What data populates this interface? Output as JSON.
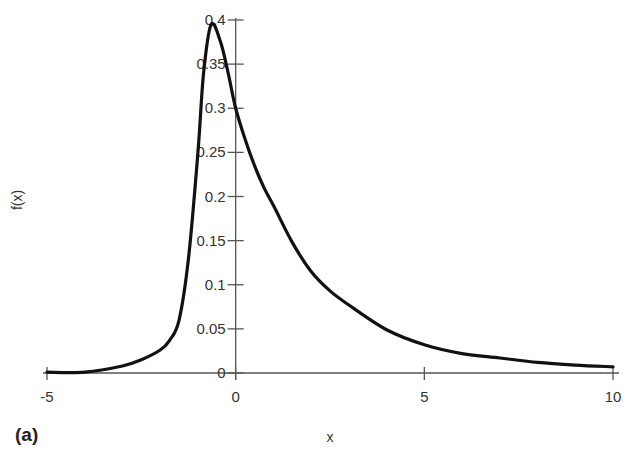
{
  "chart_data": {
    "type": "line",
    "title": "",
    "panel_label": "(a)",
    "xlabel": "x",
    "ylabel": "f(x)",
    "xlim": [
      -5,
      10
    ],
    "ylim": [
      0,
      0.4
    ],
    "grid": false,
    "legend": null,
    "x_ticks": [
      -5,
      0,
      5,
      10
    ],
    "x_tick_labels": [
      "-5",
      "0",
      "5",
      "10"
    ],
    "y_ticks": [
      0,
      0.05,
      0.1,
      0.15,
      0.2,
      0.25,
      0.3,
      0.35,
      0.4
    ],
    "y_tick_labels": [
      "0",
      "0.05",
      "0.1",
      "0.15",
      "0.2",
      "0.25",
      "0.3",
      "0.35",
      "0.4"
    ],
    "series": [
      {
        "name": "f(x)",
        "color": "#111111",
        "x": [
          -5,
          -4,
          -3,
          -2.5,
          -2,
          -1.75,
          -1.5,
          -1.25,
          -1,
          -0.85,
          -0.65,
          -0.4,
          -0.2,
          0,
          0.25,
          0.5,
          0.75,
          1,
          1.5,
          2,
          2.5,
          3,
          4,
          5,
          6,
          7,
          8,
          9,
          10
        ],
        "values": [
          0.001,
          0.001,
          0.008,
          0.015,
          0.026,
          0.037,
          0.06,
          0.13,
          0.25,
          0.34,
          0.395,
          0.375,
          0.34,
          0.3,
          0.265,
          0.235,
          0.21,
          0.19,
          0.148,
          0.115,
          0.093,
          0.077,
          0.049,
          0.032,
          0.022,
          0.017,
          0.012,
          0.009,
          0.007
        ]
      }
    ]
  }
}
